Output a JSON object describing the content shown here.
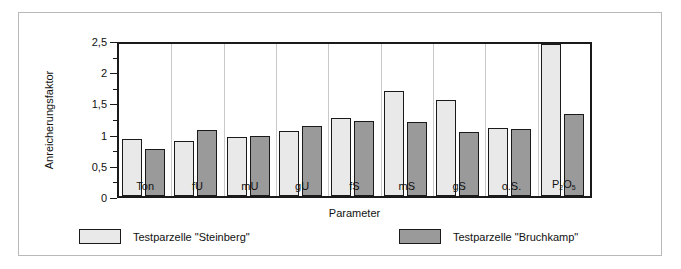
{
  "chart_data": {
    "type": "bar",
    "title": "",
    "xlabel": "Parameter",
    "ylabel": "Anreicherungsfaktor",
    "ylim": [
      0,
      2.5
    ],
    "yticks": [
      "0",
      "0,5",
      "1",
      "1,5",
      "2",
      "2,5"
    ],
    "ytick_values": [
      0,
      0.5,
      1,
      1.5,
      2,
      2.5
    ],
    "grid": "vertical-category-separators",
    "legend_position": "bottom",
    "categories": [
      "Ton",
      "fU",
      "mU",
      "gU",
      "fS",
      "mS",
      "gS",
      "o.S.",
      "P2O5"
    ],
    "category_labels_html": [
      "Ton",
      "fU",
      "mU",
      "gU",
      "fS",
      "mS",
      "gS",
      "o.S.",
      "P<sub>2</sub>O<sub>5</sub>"
    ],
    "series": [
      {
        "name": "Testparzelle \"Steinberg\"",
        "color": "#e9e9e9",
        "values": [
          0.92,
          0.88,
          0.95,
          1.04,
          1.25,
          1.68,
          1.54,
          1.09,
          2.43
        ]
      },
      {
        "name": "Testparzelle \"Bruchkamp\"",
        "color": "#9a9a9a",
        "values": [
          0.75,
          1.05,
          0.96,
          1.12,
          1.21,
          1.18,
          1.02,
          1.08,
          1.31
        ]
      }
    ]
  },
  "legend": {
    "items": [
      {
        "label": "Testparzelle \"Steinberg\"",
        "swatch": "s1"
      },
      {
        "label": "Testparzelle \"Bruchkamp\"",
        "swatch": "s2"
      }
    ]
  },
  "axis": {
    "y_title": "Anreicherungsfaktor",
    "x_title": "Parameter"
  },
  "colors": {
    "series1": "#e9e9e9",
    "series2": "#9a9a9a",
    "axis": "#1a1a1a",
    "grid": "#c9c9c9",
    "frame": "#b9b9b9",
    "background": "#ffffff"
  }
}
